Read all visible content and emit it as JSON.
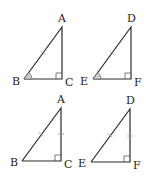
{
  "diagram": {
    "type": "congruent right triangles",
    "colors": {
      "line": "#2a2a2a",
      "tick": "#9a9a9a",
      "angle_fill": "#cfcfcf"
    },
    "panels": [
      {
        "id": "top-left",
        "vertices": {
          "top": "A",
          "bottom_left": "B",
          "right_angle": "C"
        },
        "marks": [
          "hypotenuse single tick",
          "angle B marked",
          "right angle at C"
        ]
      },
      {
        "id": "top-right",
        "vertices": {
          "top": "D",
          "bottom_left": "E",
          "right_angle": "F"
        },
        "marks": [
          "hypotenuse single tick",
          "angle E marked",
          "right angle at F"
        ]
      },
      {
        "id": "bottom-left",
        "vertices": {
          "top": "A",
          "bottom_left": "B",
          "right_angle": "C"
        },
        "marks": [
          "hypotenuse single tick",
          "leg AC single tick",
          "right angle at C"
        ]
      },
      {
        "id": "bottom-right",
        "vertices": {
          "top": "D",
          "bottom_left": "E",
          "right_angle": "F"
        },
        "marks": [
          "hypotenuse single tick",
          "leg DF single tick",
          "right angle at F"
        ]
      }
    ]
  }
}
